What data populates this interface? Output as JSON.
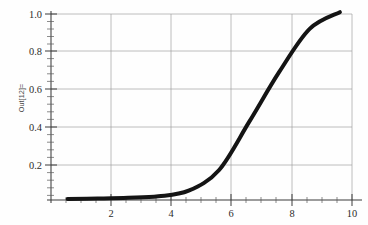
{
  "figure": {
    "output_label": "Out[12]=",
    "background_color": "#fefefe",
    "curve_color": "#141414",
    "grid_color": "#9a9a9a",
    "axis_color": "#3a3a3a"
  },
  "chart_data": {
    "type": "line",
    "title": "",
    "xlabel": "",
    "ylabel": "Out[12]=",
    "xlim": [
      0.45,
      10.4
    ],
    "ylim": [
      0.0,
      1.05
    ],
    "grid": true,
    "legend": null,
    "x_ticks": [
      2,
      4,
      6,
      8,
      10
    ],
    "x_tick_labels": [
      "2",
      "4",
      "6",
      "8",
      "10"
    ],
    "y_ticks": [
      0.2,
      0.4,
      0.6,
      0.8,
      1.0
    ],
    "y_tick_labels": [
      "0.2",
      "0.4",
      "0.6",
      "0.8",
      "1.0"
    ],
    "x_minor_per_major": 4,
    "y_minor_per_major": 4,
    "series": [
      {
        "name": "curve",
        "x": [
          1,
          2,
          3,
          4,
          5,
          6,
          7,
          8,
          9,
          10
        ],
        "values": [
          0.005,
          0.008,
          0.012,
          0.02,
          0.05,
          0.16,
          0.42,
          0.69,
          0.92,
          1.01
        ]
      }
    ]
  }
}
